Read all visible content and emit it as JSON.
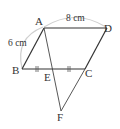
{
  "diagram": {
    "points": {
      "A": "A",
      "B": "B",
      "C": "C",
      "D": "D",
      "E": "E",
      "F": "F"
    },
    "measurements": {
      "AD": "8 cm",
      "AB": "6 cm"
    },
    "markings": {
      "BE_EC_equal": "BE = EC (tick marks)"
    },
    "colors": {
      "line": "#333333",
      "arc": "#c8c8c8"
    }
  }
}
